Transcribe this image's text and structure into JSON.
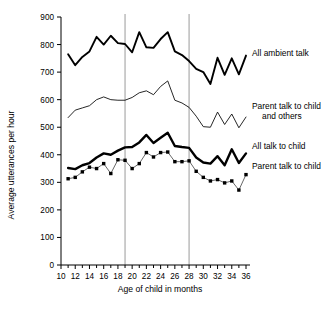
{
  "chart_data": {
    "type": "line",
    "title": "",
    "xlabel": "Age of child in months",
    "ylabel": "Average utterances per hour",
    "xlim": [
      10,
      36
    ],
    "ylim": [
      0,
      900
    ],
    "ytick_step": 100,
    "yticks": [
      0,
      100,
      200,
      300,
      400,
      500,
      600,
      700,
      800,
      900
    ],
    "xticks_major": [
      10,
      12,
      14,
      16,
      18,
      20,
      22,
      24,
      26,
      28,
      30,
      32,
      34,
      36
    ],
    "xticks_minor_step": 1,
    "grid": false,
    "legend_position": "right-inline",
    "reference_lines": [
      19,
      28
    ],
    "x": [
      11,
      12,
      13,
      14,
      15,
      16,
      17,
      18,
      19,
      20,
      21,
      22,
      23,
      24,
      25,
      26,
      27,
      28,
      29,
      30,
      31,
      32,
      33,
      34,
      35,
      36
    ],
    "series": [
      {
        "name": "All ambient talk",
        "label": "All ambient talk",
        "style": "thick-line",
        "values": [
          765,
          725,
          755,
          775,
          828,
          800,
          832,
          805,
          802,
          772,
          845,
          790,
          788,
          820,
          845,
          775,
          762,
          740,
          712,
          700,
          657,
          752,
          690,
          750,
          692,
          760
        ]
      },
      {
        "name": "Parent talk to child and others",
        "label_line1": "Parent talk to child",
        "label_line2": "and others",
        "style": "thin-line",
        "values": [
          535,
          562,
          570,
          578,
          600,
          610,
          600,
          598,
          598,
          608,
          625,
          632,
          618,
          648,
          668,
          598,
          588,
          572,
          540,
          502,
          500,
          555,
          510,
          548,
          498,
          537
        ]
      },
      {
        "name": "All talk to child",
        "label": "All talk to child",
        "style": "very-thick-line",
        "values": [
          352,
          348,
          362,
          370,
          390,
          405,
          400,
          415,
          427,
          428,
          445,
          472,
          443,
          462,
          480,
          432,
          428,
          425,
          390,
          372,
          368,
          395,
          362,
          420,
          370,
          405
        ]
      },
      {
        "name": "Parent talk to child",
        "label": "Parent talk to child",
        "style": "dotted-markers",
        "values": [
          313,
          318,
          338,
          355,
          350,
          368,
          332,
          382,
          380,
          350,
          368,
          408,
          392,
          408,
          410,
          375,
          375,
          378,
          340,
          318,
          305,
          310,
          298,
          305,
          272,
          328
        ]
      }
    ]
  },
  "axis": {
    "y_title": "Average utterances per hour",
    "x_title": "Age of child in months"
  },
  "legend": {
    "ambient": "All ambient talk",
    "parent_others_line1": "Parent talk to child",
    "parent_others_line2": "and others",
    "all_child": "All talk to child",
    "parent_child": "Parent talk to child"
  },
  "colors": {
    "ink": "#000000",
    "reference_line": "#9a9a9a",
    "background": "#ffffff"
  }
}
